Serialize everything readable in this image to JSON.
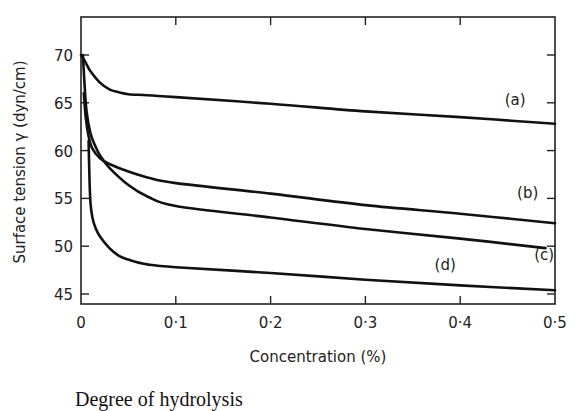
{
  "chart_data": {
    "type": "line",
    "title": "",
    "xlabel": "Concentration (%)",
    "ylabel": "Surface tension γ (dyn/cm)",
    "xlim": [
      0,
      0.5
    ],
    "ylim": [
      44,
      73
    ],
    "grid": false,
    "legend_position": "inline labels at curve ends",
    "x_ticks": [
      0,
      0.1,
      0.2,
      0.3,
      0.4,
      0.5
    ],
    "x_tick_labels": [
      "0",
      "0·1",
      "0·2",
      "0·3",
      "0·4",
      "0·5"
    ],
    "y_ticks": [
      45,
      50,
      55,
      60,
      65,
      70
    ],
    "y_tick_labels": [
      "45",
      "50",
      "55",
      "60",
      "65",
      "70"
    ],
    "series": [
      {
        "name": "(a)",
        "x": [
          0,
          0.005,
          0.01,
          0.02,
          0.03,
          0.04,
          0.05,
          0.07,
          0.1,
          0.2,
          0.3,
          0.4,
          0.5
        ],
        "y": [
          70.0,
          69.2,
          68.3,
          67.1,
          66.4,
          66.1,
          65.9,
          65.8,
          65.6,
          64.9,
          64.1,
          63.5,
          62.8
        ],
        "label_pos": [
          0.447,
          64.8
        ]
      },
      {
        "name": "(b)",
        "x": [
          0.003,
          0.005,
          0.008,
          0.012,
          0.02,
          0.03,
          0.05,
          0.07,
          0.1,
          0.2,
          0.3,
          0.4,
          0.5
        ],
        "y": [
          66.0,
          63.5,
          61.5,
          60.2,
          59.2,
          58.6,
          57.8,
          57.2,
          56.6,
          55.5,
          54.3,
          53.4,
          52.4
        ],
        "label_pos": [
          0.46,
          55.0
        ]
      },
      {
        "name": "(c)",
        "x": [
          0.002,
          0.004,
          0.006,
          0.01,
          0.015,
          0.02,
          0.03,
          0.05,
          0.07,
          0.1,
          0.2,
          0.3,
          0.4,
          0.49
        ],
        "y": [
          70.0,
          66.5,
          64.0,
          61.8,
          60.5,
          59.5,
          58.2,
          56.4,
          55.2,
          54.2,
          53.0,
          51.8,
          50.8,
          49.8
        ],
        "label_pos": [
          0.478,
          48.6
        ]
      },
      {
        "name": "(d)",
        "x": [
          0.008,
          0.009,
          0.01,
          0.012,
          0.015,
          0.02,
          0.03,
          0.04,
          0.05,
          0.07,
          0.1,
          0.2,
          0.3,
          0.4,
          0.5
        ],
        "y": [
          61.0,
          57.0,
          54.5,
          53.0,
          52.0,
          51.0,
          49.8,
          49.0,
          48.6,
          48.1,
          47.8,
          47.2,
          46.5,
          45.9,
          45.4
        ],
        "label_pos": [
          0.373,
          47.5
        ]
      }
    ],
    "annotations": [
      "(a)",
      "(b)",
      "(c)",
      "(d)"
    ]
  },
  "caption_fragment": "Degree of hydrolysis"
}
